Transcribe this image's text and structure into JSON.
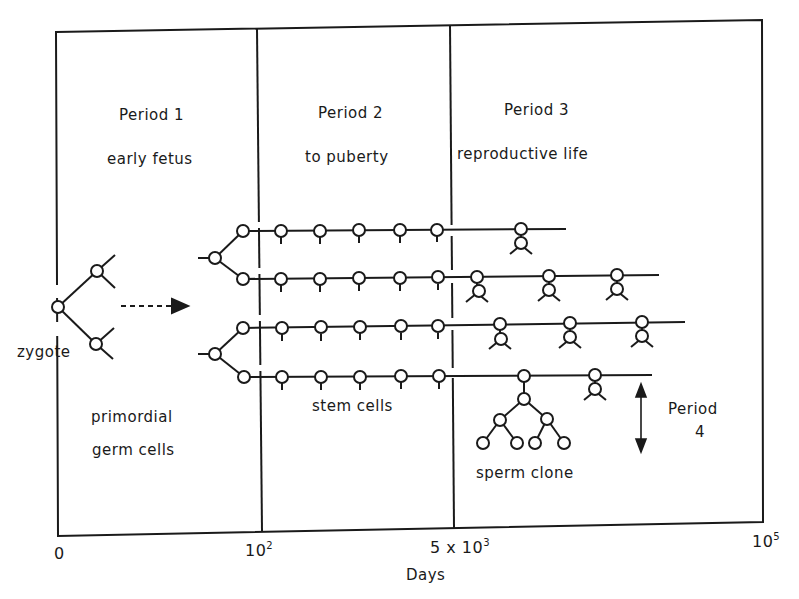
{
  "diagram": {
    "periods": [
      {
        "title": "Period 1",
        "subtitle": "early fetus"
      },
      {
        "title": "Period 2",
        "subtitle": "to puberty"
      },
      {
        "title": "Period 3",
        "subtitle": "reproductive life"
      },
      {
        "title": "Period",
        "subtitle": "4"
      }
    ],
    "labels": {
      "zygote": "zygote",
      "primordial_line1": "primordial",
      "primordial_line2": "germ cells",
      "stem_cells": "stem cells",
      "sperm_clone": "sperm clone"
    },
    "axis": {
      "label": "Days",
      "ticks": [
        {
          "base": "0",
          "exp": ""
        },
        {
          "base": "10",
          "exp": "2"
        },
        {
          "base": "5 x 10",
          "exp": "3"
        },
        {
          "base": "10",
          "exp": "5"
        }
      ]
    },
    "colors": {
      "line": "#1a1a1a",
      "background": "#ffffff"
    }
  }
}
